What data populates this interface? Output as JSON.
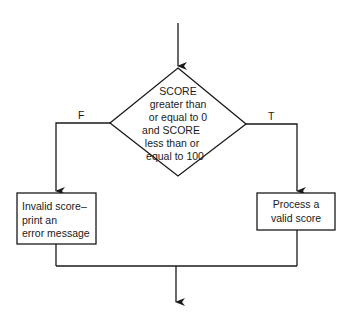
{
  "diagram": {
    "type": "flowchart",
    "decision": {
      "shape": "diamond",
      "lines": [
        "SCORE",
        "greater than",
        "or equal to 0",
        "and SCORE",
        "less than or",
        "equal to 100"
      ]
    },
    "branches": {
      "false_label": "F",
      "true_label": "T"
    },
    "false_process": {
      "shape": "rectangle",
      "lines": [
        "Invalid score–",
        "print an",
        "error message"
      ]
    },
    "true_process": {
      "shape": "rectangle",
      "lines": [
        "Process a",
        "valid score"
      ]
    },
    "colors": {
      "line": "#1a1a1a",
      "background": "#ffffff"
    }
  }
}
